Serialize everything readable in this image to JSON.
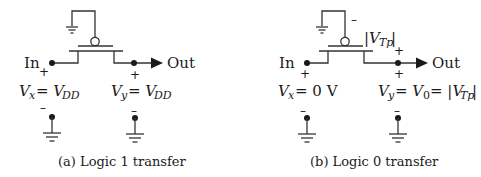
{
  "figure": {
    "panels": [
      {
        "id": "a",
        "caption": "(a) Logic 1 transfer",
        "input_label": "In",
        "output_label": "Out",
        "vx_label": "V",
        "vx_sub": "x",
        "vx_eq": " = V",
        "vx_val_sub": "DD",
        "vy_label": "V",
        "vy_sub": "y",
        "vy_eq": " = V",
        "vy_val_sub": "DD",
        "plus": "+",
        "minus": "–"
      },
      {
        "id": "b",
        "caption": "(b) Logic 0 transfer",
        "input_label": "In",
        "output_label": "Out",
        "vx_label": "V",
        "vx_sub": "x",
        "vx_eq": " = 0 V",
        "vy_label": "V",
        "vy_sub": "y",
        "vy_eq": "  = V",
        "vy_val_sub": "0",
        "vy_eq2": " = |V",
        "vy_val2_sub": "Tp",
        "vy_end": " |",
        "vtp_label": "|V",
        "vtp_sub": "Tp",
        "vtp_end": " |",
        "plus": "+",
        "minus": "–"
      }
    ],
    "colors": {
      "wire": "#333333",
      "text": "#1a1a1a",
      "background": "#ffffff"
    }
  }
}
